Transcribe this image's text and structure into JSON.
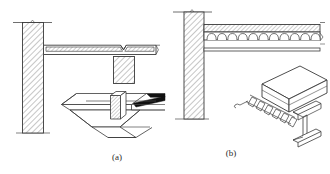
{
  "figure": {
    "background_color": "#ffffff",
    "line_color": "#3a3a3a",
    "hatch_color": "#555555",
    "fill_color": "#ffffff",
    "solid_edge_color": "#111111",
    "width": 330,
    "height": 174,
    "panels": [
      {
        "id": "a",
        "caption": "(a)",
        "caption_x": 117,
        "caption_y": 160,
        "description": "Cross-section of wall/column supporting a hatched concrete slab with a V-joint and a hatched rib block below, plus an isometric view of a trapezoidal profiled steel deck panel",
        "parts": [
          {
            "name": "wall-column-section",
            "kind": "hatched-vertical-member"
          },
          {
            "name": "slab-section",
            "kind": "hatched-horizontal-slab"
          },
          {
            "name": "slab-joint-notch",
            "kind": "v-notch"
          },
          {
            "name": "rib-block-section",
            "kind": "hatched-rectangle"
          },
          {
            "name": "deck-isometric",
            "kind": "trapezoidal-profiled-deck"
          }
        ]
      },
      {
        "id": "b",
        "caption": "(b)",
        "caption_x": 231,
        "caption_y": 156,
        "description": "Cross-section of wall supporting a composite slab with rounded arch corrugations over a steel beam flange, plus an isometric view of a concrete slab on corrugated steel deck resting on an I-beam",
        "parts": [
          {
            "name": "wall-section",
            "kind": "hatched-vertical-member"
          },
          {
            "name": "composite-slab-section",
            "kind": "hatched-slab-with-arch-ribs"
          },
          {
            "name": "arch-rib-count",
            "kind": "count",
            "value": 11
          },
          {
            "name": "beam-flange-line",
            "kind": "thin-horizontal-band"
          },
          {
            "name": "slab-deck-beam-isometric",
            "kind": "isometric-assembly"
          },
          {
            "name": "deck-rib-count-isometric",
            "kind": "count",
            "value": 6
          }
        ]
      }
    ]
  }
}
